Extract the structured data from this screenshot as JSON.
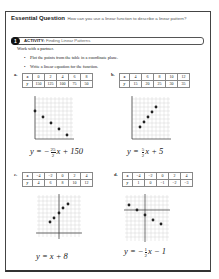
{
  "header": {
    "title": "Essential Question",
    "question": "How can you use a linear function to describe a linear pattern?"
  },
  "activity": {
    "number": "1",
    "label": "ACTIVITY:",
    "title": "Finding Linear Patterns"
  },
  "instructions": {
    "intro": "Work with a partner.",
    "bullets": [
      "Plot the points from the table in a coordinate plane.",
      "Write a linear equation for the function."
    ]
  },
  "problems": [
    {
      "label": "a.",
      "x": [
        "0",
        "2",
        "4",
        "6",
        "8"
      ],
      "y": [
        "150",
        "125",
        "100",
        "75",
        "50"
      ],
      "equation": {
        "lhs": "y = −",
        "num": "25",
        "den": "2",
        "rhs": "x + 150"
      }
    },
    {
      "label": "b.",
      "x": [
        "4",
        "6",
        "8",
        "10",
        "12"
      ],
      "y": [
        "15",
        "20",
        "25",
        "30",
        "35"
      ],
      "equation": {
        "lhs": "y = ",
        "num": "5",
        "den": "2",
        "rhs": "x + 5"
      }
    },
    {
      "label": "c.",
      "x": [
        "−4",
        "−2",
        "0",
        "2",
        "4"
      ],
      "y": [
        "4",
        "6",
        "8",
        "10",
        "12"
      ],
      "equation": {
        "lhs": "y = x + 8"
      }
    },
    {
      "label": "d.",
      "x": [
        "−4",
        "−2",
        "0",
        "2",
        "4"
      ],
      "y": [
        "1",
        "0",
        "−1",
        "−2",
        "−3"
      ],
      "equation": {
        "lhs": "y = −",
        "num": "1",
        "den": "2",
        "rhs": "x − 1"
      }
    }
  ],
  "table_headers": {
    "x": "x",
    "y": "y"
  }
}
